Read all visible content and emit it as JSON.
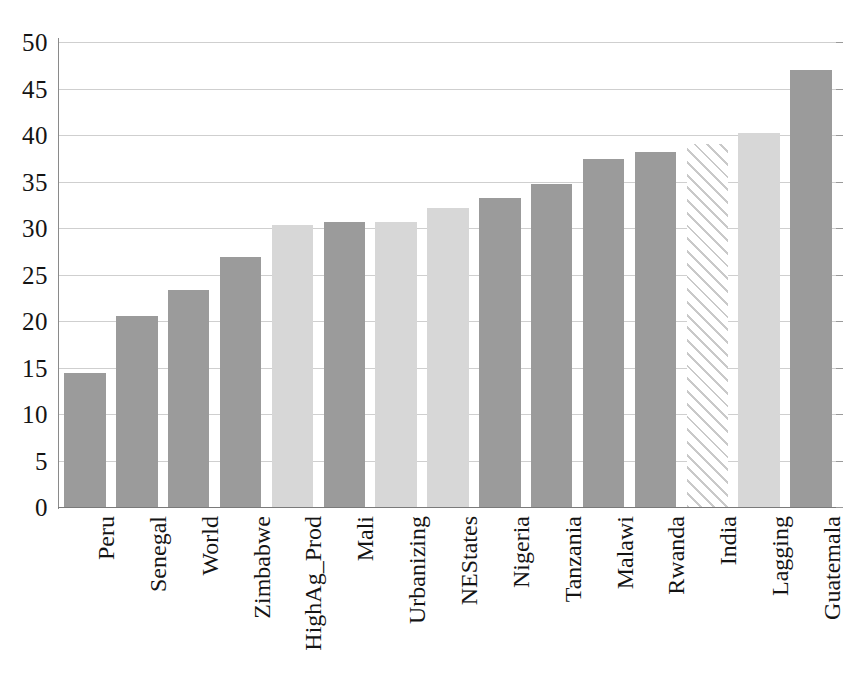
{
  "chart_data": {
    "type": "bar",
    "title": "",
    "subtitle": "",
    "xlabel": "",
    "ylabel": "",
    "ylim": [
      0,
      50
    ],
    "ytick_step": 5,
    "ytick_labels": [
      "50",
      "45",
      "40",
      "35",
      "30",
      "25",
      "20",
      "15",
      "10",
      "5",
      "0"
    ],
    "ytick_values": [
      50,
      45,
      40,
      35,
      30,
      25,
      20,
      15,
      10,
      5,
      0
    ],
    "grid": true,
    "grid_axis": "y",
    "legend": null,
    "legend_position": "none",
    "annotations": [],
    "categories": [
      "Peru",
      "Senegal",
      "World",
      "Zimbabwe",
      "HighAg_Prod",
      "Mali",
      "Urbanizing",
      "NEStates",
      "Nigeria",
      "Tanzania",
      "Malawi",
      "Rwanda",
      "India",
      "Lagging",
      "Guatemala"
    ],
    "values": [
      14.4,
      20.5,
      23.3,
      26.9,
      30.3,
      30.6,
      30.6,
      32.2,
      33.2,
      34.7,
      37.4,
      38.2,
      39.0,
      40.2,
      47.0
    ],
    "bar_styles": [
      "dark",
      "dark",
      "dark",
      "dark",
      "light",
      "dark",
      "light",
      "light",
      "dark",
      "dark",
      "dark",
      "dark",
      "hatch",
      "light",
      "dark"
    ],
    "colors": {
      "dark_bar": "#9b9b9b",
      "light_bar": "#d7d7d7",
      "hatch_bar_stroke": "#c9c9c9",
      "hatch_bar_fill": "#ffffff",
      "gridline": "#cfcfcf",
      "axis": "#7a7a7a",
      "text": "#141414",
      "background": "#ffffff"
    }
  }
}
